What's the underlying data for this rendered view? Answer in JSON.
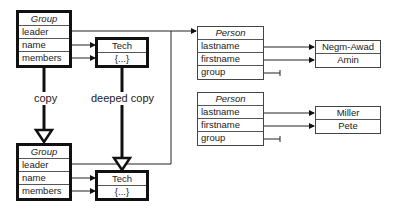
{
  "group_top": {
    "title": "Group",
    "fields": [
      "leader",
      "name",
      "members"
    ]
  },
  "tech_top": {
    "title": "Tech",
    "content": "{...}"
  },
  "group_bottom": {
    "title": "Group",
    "fields": [
      "leader",
      "name",
      "members"
    ]
  },
  "tech_bottom": {
    "title": "Tech",
    "content": "{...}"
  },
  "labels": {
    "copy": "copy",
    "deep_copy": "deeped copy"
  },
  "person1": {
    "title": "Person",
    "fields": [
      "lastname",
      "firstname",
      "group"
    ],
    "values": [
      "Negm-Awad",
      "Amin"
    ]
  },
  "person2": {
    "title": "Person",
    "fields": [
      "lastname",
      "firstname",
      "group"
    ],
    "values": [
      "Miller",
      "Pete"
    ]
  }
}
